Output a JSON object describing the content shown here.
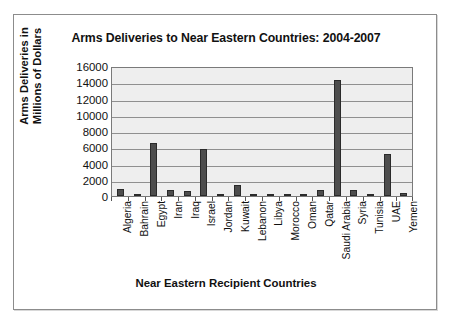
{
  "chart_data": {
    "type": "bar",
    "title": "Arms Deliveries to Near Eastern Countries: 2004-2007",
    "xlabel": "Near Eastern Recipient Countries",
    "ylabel": "Arms Deliveries in Millions of Dollars",
    "ylabel_line1": "Arms Deliveries in",
    "ylabel_line2": "Millions of Dollars",
    "ylim": [
      0,
      16000
    ],
    "ytick_step": 2000,
    "ytick_labels": [
      "16000",
      "14000",
      "12000",
      "10000",
      "8000",
      "6000",
      "4000",
      "2000",
      "0"
    ],
    "ytick_values": [
      16000,
      14000,
      12000,
      10000,
      8000,
      6000,
      4000,
      2000,
      0
    ],
    "grid": true,
    "legend": "none",
    "bar_color": "#4d4d4d",
    "plot_background": "#eeeeee",
    "categories": [
      "Algeria",
      "Bahrain",
      "Egypt",
      "Iran",
      "Iraq",
      "Israel",
      "Jordan",
      "Kuwait",
      "Lebanon",
      "Libya",
      "Morocco",
      "Oman",
      "Qatar",
      "Saudi Arabia",
      "Syria",
      "Tunisia",
      "UAE",
      "Yemen"
    ],
    "values": [
      900,
      200,
      6500,
      700,
      600,
      5800,
      300,
      1400,
      100,
      100,
      300,
      300,
      700,
      14300,
      700,
      100,
      5200,
      400
    ]
  }
}
